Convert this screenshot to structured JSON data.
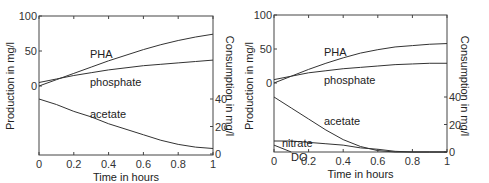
{
  "chart_data": [
    {
      "type": "line",
      "title": "",
      "xlabel": "Time in hours",
      "ylabel_left": "Production in mg/l",
      "ylabel_right": "Consumption in mg/l",
      "xlim": [
        0,
        1
      ],
      "ylim_left": [
        -100,
        100
      ],
      "ylim_right": [
        0,
        110
      ],
      "x_ticks": [
        "0",
        "0.2",
        "0.4",
        "0.6",
        "0.8",
        "1"
      ],
      "y_ticks_left": [
        "0",
        "50",
        "100"
      ],
      "y_ticks_right": [
        "0",
        "20",
        "40"
      ],
      "x": [
        0,
        0.1,
        0.2,
        0.3,
        0.4,
        0.5,
        0.6,
        0.7,
        0.8,
        0.9,
        1.0
      ],
      "series": [
        {
          "name": "PHA",
          "axis": "left",
          "values": [
            0,
            9,
            18,
            27,
            36,
            44,
            52,
            59,
            65,
            70,
            74
          ]
        },
        {
          "name": "phosphate",
          "axis": "left",
          "values": [
            5,
            10,
            15,
            19,
            23,
            26,
            29,
            31,
            33,
            35,
            37
          ]
        },
        {
          "name": "acetate",
          "axis": "right",
          "values": [
            40,
            36,
            31,
            27,
            22,
            18,
            14,
            10,
            7,
            5,
            4
          ]
        }
      ],
      "annotations": [
        "PHA",
        "phosphate",
        "acetate"
      ],
      "grid": false
    },
    {
      "type": "line",
      "title": "",
      "xlabel": "Time in hours",
      "ylabel_left": "Production in mg/l",
      "ylabel_right": "Consumption in mg/l",
      "xlim": [
        0,
        1
      ],
      "ylim_left": [
        -100,
        100
      ],
      "ylim_right": [
        0,
        110
      ],
      "x_ticks": [
        "0",
        "0.2",
        "0.4",
        "0.6",
        "0.8",
        "1"
      ],
      "y_ticks_left": [
        "0",
        "50",
        "100"
      ],
      "y_ticks_right": [
        "0",
        "20",
        "40"
      ],
      "x": [
        0,
        0.1,
        0.2,
        0.3,
        0.4,
        0.5,
        0.6,
        0.7,
        0.8,
        0.9,
        1.0
      ],
      "series": [
        {
          "name": "PHA",
          "axis": "left",
          "values": [
            0,
            10,
            20,
            29,
            37,
            44,
            49,
            53,
            55,
            57,
            58
          ]
        },
        {
          "name": "phosphate",
          "axis": "left",
          "values": [
            5,
            10,
            15,
            18,
            21,
            23,
            25,
            27,
            28,
            29,
            29
          ]
        },
        {
          "name": "acetate",
          "axis": "right",
          "values": [
            40,
            32,
            24,
            16,
            9,
            4,
            1,
            0,
            0,
            0,
            0
          ]
        },
        {
          "name": "nitrate",
          "axis": "right",
          "values": [
            8,
            8,
            7,
            6,
            5,
            3,
            2,
            0.5,
            0,
            0,
            0
          ]
        },
        {
          "name": "DO",
          "axis": "right",
          "values": [
            5,
            0,
            0,
            0,
            0,
            0,
            0,
            0,
            0,
            0,
            0
          ]
        }
      ],
      "annotations": [
        "PHA",
        "phosphate",
        "acetate",
        "nitrate",
        "DO"
      ],
      "grid": false
    }
  ],
  "labels": {
    "xlabel": "Time in hours",
    "ylabel_left": "Production in mg/l",
    "ylabel_right": "Consumption in mg/l"
  }
}
